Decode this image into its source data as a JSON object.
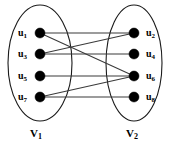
{
  "figure": {
    "type": "bipartite-graph-diagram",
    "width": 174,
    "height": 150,
    "background_color": "#ffffff",
    "node_color": "#000000",
    "edge_color": "#3a3a3a",
    "ellipse_color": "#1a1a1a"
  },
  "sets": {
    "left": {
      "name": "V",
      "subscript": "1",
      "label_full": "V1",
      "ellipse": {
        "cx": 40,
        "cy": 63,
        "rx": 32,
        "ry": 58
      },
      "label_pos": {
        "x": 30,
        "y": 128
      }
    },
    "right": {
      "name": "V",
      "subscript": "2",
      "label_full": "V2",
      "ellipse": {
        "cx": 134,
        "cy": 63,
        "rx": 28,
        "ry": 58
      },
      "label_pos": {
        "x": 126,
        "y": 128
      }
    }
  },
  "nodes": [
    {
      "id": "u1",
      "name": "u",
      "subscript": "1",
      "set": "left",
      "cx": 40,
      "cy": 33,
      "r": 5.0,
      "label_x": 18,
      "label_y": 28
    },
    {
      "id": "u3",
      "name": "u",
      "subscript": "3",
      "set": "left",
      "cx": 40,
      "cy": 54,
      "r": 5.0,
      "label_x": 18,
      "label_y": 49
    },
    {
      "id": "u5",
      "name": "u",
      "subscript": "5",
      "set": "left",
      "cx": 40,
      "cy": 76,
      "r": 5.0,
      "label_x": 18,
      "label_y": 71
    },
    {
      "id": "u7",
      "name": "u",
      "subscript": "7",
      "set": "left",
      "cx": 40,
      "cy": 97,
      "r": 5.0,
      "label_x": 18,
      "label_y": 92
    },
    {
      "id": "u2",
      "name": "u",
      "subscript": "2",
      "set": "right",
      "cx": 134,
      "cy": 33,
      "r": 5.0,
      "label_x": 146,
      "label_y": 28
    },
    {
      "id": "u4",
      "name": "u",
      "subscript": "4",
      "set": "right",
      "cx": 134,
      "cy": 54,
      "r": 5.0,
      "label_x": 146,
      "label_y": 49
    },
    {
      "id": "u6",
      "name": "u",
      "subscript": "6",
      "set": "right",
      "cx": 134,
      "cy": 76,
      "r": 5.0,
      "label_x": 146,
      "label_y": 71
    },
    {
      "id": "u8",
      "name": "u",
      "subscript": "8",
      "set": "right",
      "cx": 134,
      "cy": 97,
      "r": 5.0,
      "label_x": 146,
      "label_y": 92
    }
  ],
  "edges": [
    {
      "id": "e1",
      "from": "u1",
      "to": "u2",
      "x1": 40,
      "y1": 33,
      "x2": 134,
      "y2": 33
    },
    {
      "id": "e2",
      "from": "u1",
      "to": "u6",
      "x1": 40,
      "y1": 33,
      "x2": 134,
      "y2": 76
    },
    {
      "id": "e3",
      "from": "u3",
      "to": "u2",
      "x1": 40,
      "y1": 54,
      "x2": 134,
      "y2": 33
    },
    {
      "id": "e4",
      "from": "u3",
      "to": "u4",
      "x1": 40,
      "y1": 54,
      "x2": 134,
      "y2": 54
    },
    {
      "id": "e5",
      "from": "u5",
      "to": "u6",
      "x1": 40,
      "y1": 76,
      "x2": 134,
      "y2": 76
    },
    {
      "id": "e6",
      "from": "u7",
      "to": "u6",
      "x1": 40,
      "y1": 97,
      "x2": 134,
      "y2": 76
    },
    {
      "id": "e7",
      "from": "u7",
      "to": "u8",
      "x1": 40,
      "y1": 97,
      "x2": 134,
      "y2": 97
    }
  ]
}
